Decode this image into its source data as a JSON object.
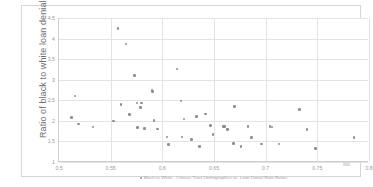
{
  "chart_data": {
    "type": "scatter",
    "title": "",
    "xlabel": "",
    "ylabel": "Ratio of black to white loan denial rates",
    "legend_label": "Black vs White - Census Tract Demographics vs. Loan Denial Rate Ratios",
    "legend_position": "bottom",
    "grid": true,
    "xlim": [
      0.5,
      0.8
    ],
    "ylim": [
      1.0,
      4.5
    ],
    "xticks": [
      "0.5",
      "0.55",
      "0.6",
      "0.65",
      "0.7",
      "0.75",
      "0.8"
    ],
    "xtick_values": [
      0.5,
      0.55,
      0.6,
      0.65,
      0.7,
      0.75,
      0.8
    ],
    "yticks": [
      "1",
      "1.5",
      "2",
      "2.5",
      "3",
      "3.5",
      "4",
      "4.5"
    ],
    "ytick_values": [
      1,
      1.5,
      2,
      2.5,
      3,
      3.5,
      4,
      4.5
    ],
    "series": [
      {
        "name": "Black vs White - Census Tract Demographics vs. Loan Denial Rate Ratios",
        "color": "#8e8e8e",
        "points": [
          [
            0.512,
            2.08
          ],
          [
            0.5155,
            2.6
          ],
          [
            0.519,
            1.92
          ],
          [
            0.533,
            1.85
          ],
          [
            0.553,
            2.0
          ],
          [
            0.557,
            4.25
          ],
          [
            0.56,
            2.4
          ],
          [
            0.565,
            3.87
          ],
          [
            0.568,
            2.15
          ],
          [
            0.573,
            3.1
          ],
          [
            0.5755,
            2.43
          ],
          [
            0.576,
            1.84
          ],
          [
            0.579,
            2.33
          ],
          [
            0.58,
            2.43
          ],
          [
            0.583,
            1.82
          ],
          [
            0.59,
            2.75
          ],
          [
            0.5905,
            2.72
          ],
          [
            0.592,
            2.01
          ],
          [
            0.5955,
            1.8
          ],
          [
            0.6045,
            1.61
          ],
          [
            0.606,
            1.42
          ],
          [
            0.614,
            3.26
          ],
          [
            0.618,
            2.48
          ],
          [
            0.619,
            1.61
          ],
          [
            0.621,
            2.05
          ],
          [
            0.6285,
            1.55
          ],
          [
            0.633,
            2.1
          ],
          [
            0.636,
            1.37
          ],
          [
            0.6415,
            2.17
          ],
          [
            0.6465,
            1.89
          ],
          [
            0.649,
            1.67
          ],
          [
            0.659,
            1.86
          ],
          [
            0.66,
            1.87
          ],
          [
            0.6625,
            1.8
          ],
          [
            0.663,
            1.79
          ],
          [
            0.669,
            1.45
          ],
          [
            0.67,
            2.35
          ],
          [
            0.676,
            1.38
          ],
          [
            0.683,
            1.86
          ],
          [
            0.6865,
            1.6
          ],
          [
            0.696,
            1.44
          ],
          [
            0.704,
            1.86
          ],
          [
            0.706,
            1.85
          ],
          [
            0.713,
            1.44
          ],
          [
            0.733,
            2.27
          ],
          [
            0.74,
            1.79
          ],
          [
            0.748,
            1.33
          ],
          [
            0.7855,
            1.6
          ]
        ]
      }
    ]
  }
}
